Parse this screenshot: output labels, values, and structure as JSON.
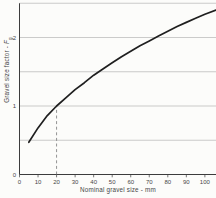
{
  "chart_data": {
    "type": "line",
    "title": "",
    "xlabel": "Nominal gravel size - mm",
    "ylabel": {
      "text": "Gravel size factor - ",
      "var": "F",
      "sub": "g"
    },
    "xlim": [
      0,
      106
    ],
    "ylim": [
      0,
      2.5
    ],
    "x_ticks": [
      0,
      10,
      20,
      30,
      40,
      50,
      60,
      70,
      80,
      90,
      100
    ],
    "y_ticks": [
      0,
      1,
      2
    ],
    "y_gridlines": [
      0.5,
      1,
      1.5,
      2,
      2.5
    ],
    "grid": "horizontal-only",
    "legend": "none",
    "reference_line": {
      "x": 20,
      "y": 1.0,
      "style": "dashed"
    },
    "series": [
      {
        "name": "gravel size factor curve",
        "points": [
          [
            5,
            0.47
          ],
          [
            10,
            0.68
          ],
          [
            15,
            0.86
          ],
          [
            20,
            1.0
          ],
          [
            25,
            1.12
          ],
          [
            30,
            1.24
          ],
          [
            35,
            1.34
          ],
          [
            40,
            1.45
          ],
          [
            45,
            1.54
          ],
          [
            50,
            1.63
          ],
          [
            55,
            1.72
          ],
          [
            60,
            1.8
          ],
          [
            65,
            1.88
          ],
          [
            70,
            1.95
          ],
          [
            75,
            2.02
          ],
          [
            80,
            2.09
          ],
          [
            85,
            2.16
          ],
          [
            90,
            2.22
          ],
          [
            95,
            2.28
          ],
          [
            100,
            2.34
          ],
          [
            106,
            2.4
          ]
        ]
      }
    ],
    "colors": {
      "curve": "#1f1f1f",
      "axis": "#3c3c3c",
      "grid": "#a9a9a9",
      "dashed": "#7a7a7a",
      "text": "#474747",
      "background": "#fcfcfa"
    }
  }
}
